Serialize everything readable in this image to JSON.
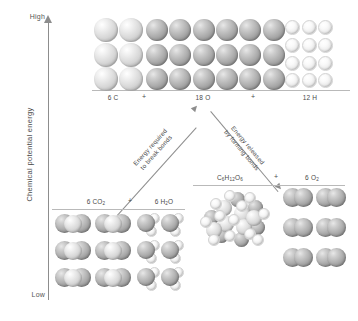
{
  "figure": {
    "type": "energy-level-diagram",
    "axis": {
      "title": "Chemical potential energy",
      "high_label": "High",
      "low_label": "Low"
    },
    "reactant_level": {
      "name": "free-atoms-level",
      "items": [
        {
          "label": "6 C",
          "element": "C",
          "count": 6,
          "cols": 2,
          "rows": 3,
          "atom_size": 24
        },
        {
          "label": "18 O",
          "element": "O",
          "count": 18,
          "cols": 6,
          "rows": 3,
          "atom_size": 22
        },
        {
          "label": "12 H",
          "element": "H",
          "count": 12,
          "cols": 3,
          "rows": 4,
          "atom_size": 13
        }
      ],
      "separators": [
        "+",
        "+"
      ]
    },
    "products_left": {
      "name": "combustion-products-level",
      "items": [
        {
          "label": "6 CO",
          "sub": "2",
          "molecule": "CO2",
          "count": 6,
          "cols": 2,
          "rows": 3
        },
        {
          "label": "6 H",
          "sub": "2",
          "label2": "O",
          "molecule": "H2O",
          "count": 6,
          "cols": 2,
          "rows": 3
        }
      ],
      "separators": [
        "+"
      ]
    },
    "products_right": {
      "name": "glucose-oxygen-level",
      "items": [
        {
          "label": "C",
          "sub1": "6",
          "mid": "H",
          "sub2": "12",
          "end": "O",
          "sub3": "6",
          "molecule": "glucose",
          "count": 1
        },
        {
          "label": "6 O",
          "sub": "2",
          "molecule": "O2",
          "count": 6,
          "cols": 2,
          "rows": 3
        }
      ],
      "separators": [
        "+"
      ]
    },
    "arrows": [
      {
        "name": "energy-required-arrow",
        "line1": "Energy required",
        "line2": "to break bonds",
        "direction": "up-right"
      },
      {
        "name": "energy-released-arrow",
        "line1": "Energy released",
        "line2": "by forming bonds",
        "direction": "down-right"
      }
    ]
  },
  "chart_data": {
    "type": "diagram",
    "ylabel": "Chemical potential energy",
    "ytick_labels": [
      "Low",
      "High"
    ],
    "levels": [
      {
        "name": "Free atoms",
        "relative_energy": 1.0,
        "species": [
          "6 C",
          "18 O",
          "12 H"
        ]
      },
      {
        "name": "Glucose + oxygen",
        "relative_energy": 0.42,
        "species": [
          "C6H12O6",
          "6 O2"
        ]
      },
      {
        "name": "Carbon dioxide + water",
        "relative_energy": 0.2,
        "species": [
          "6 CO2",
          "6 H2O"
        ]
      }
    ],
    "annotations": [
      "Energy required to break bonds",
      "Energy released by forming bonds"
    ]
  }
}
